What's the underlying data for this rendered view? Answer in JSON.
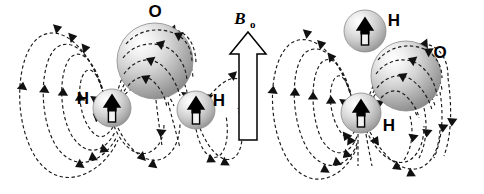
{
  "figure": {
    "width": 484,
    "height": 194,
    "background_color": "#ffffff"
  },
  "external_field": {
    "label_main": "B",
    "label_subscript": "o",
    "direction": "up",
    "arrow_fill": "#ffffff",
    "arrow_stroke": "#000000"
  },
  "molecules": [
    {
      "id": "molecule-left",
      "orientation": "h-h-axis-horizontal",
      "oxygen": {
        "label": "O",
        "cx": 155,
        "cy": 61,
        "r": 38
      },
      "hydrogens": [
        {
          "label": "H",
          "cx": 112,
          "cy": 108,
          "r": 19,
          "label_x": 83,
          "label_y": 104,
          "spin_direction": "up"
        },
        {
          "label": "H",
          "cx": 196,
          "cy": 110,
          "r": 19,
          "label_x": 219,
          "label_y": 106,
          "spin_direction": "up"
        }
      ]
    },
    {
      "id": "molecule-right",
      "orientation": "h-h-axis-vertical",
      "oxygen": {
        "label": "O",
        "cx": 406,
        "cy": 76,
        "r": 35,
        "label_x": 440,
        "label_y": 58
      },
      "hydrogens": [
        {
          "label": "H",
          "cx": 365,
          "cy": 31,
          "r": 21,
          "label_x": 394,
          "label_y": 26,
          "spin_direction": "up"
        },
        {
          "label": "H",
          "cx": 361,
          "cy": 113,
          "r": 20,
          "label_x": 389,
          "label_y": 131,
          "spin_direction": "up"
        }
      ]
    }
  ],
  "field_lines": {
    "style": "dashed",
    "color": "#1a1a1a",
    "arrowhead_color": "#111111",
    "dash_pattern": "3.4 2.6"
  },
  "colors": {
    "sphere_highlight": "#ffffff",
    "sphere_midtone": "#d8d8d8",
    "sphere_shadow": "#8e8e8e",
    "outline": "#8a8a8a",
    "text": "#000000"
  }
}
